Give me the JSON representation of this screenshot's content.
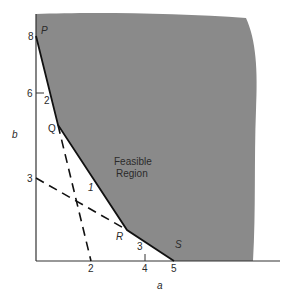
{
  "diagram": {
    "type": "linear-programming-feasible-region",
    "region_label_line1": "Feasible",
    "region_label_line2": "Region",
    "axes": {
      "x_label": "a",
      "y_label": "b",
      "x_ticks": [
        "2",
        "4",
        "5"
      ],
      "y_ticks": [
        "8",
        "6",
        "3"
      ]
    },
    "vertices": {
      "P": "P",
      "Q": "Q",
      "R": "R",
      "S": "S"
    },
    "segment_labels": {
      "PQ": "2",
      "QR": "1",
      "RS": "3"
    },
    "colors": {
      "feasible_fill": "#8a8a8a",
      "boundary": "#111111",
      "axis": "#333333",
      "constraint_dash": "#111111"
    }
  }
}
